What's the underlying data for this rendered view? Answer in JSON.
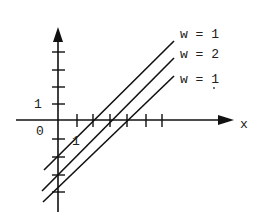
{
  "diagram": {
    "type": "coordinate-plot",
    "axes": {
      "x_label": "x",
      "origin_label": "0",
      "y_unit_label": "1",
      "x_unit_label": "1"
    },
    "lines": [
      {
        "label": "w = 1",
        "x1": 44,
        "y1": 170,
        "x2": 174,
        "y2": 41
      },
      {
        "label": "w = 2",
        "x1": 42,
        "y1": 191,
        "x2": 174,
        "y2": 58
      },
      {
        "label": "w = 1",
        "x1": 43,
        "y1": 202,
        "x2": 174,
        "y2": 76
      }
    ],
    "line_color": "#111111"
  }
}
